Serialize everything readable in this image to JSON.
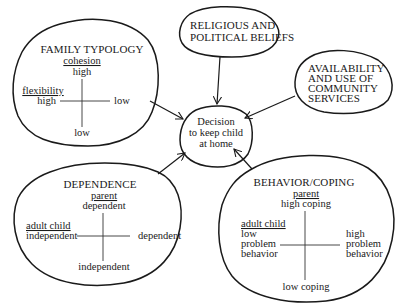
{
  "diagram": {
    "center": {
      "lines": [
        "Decision",
        "to keep child",
        "at home"
      ]
    },
    "family_typology": {
      "title": "FAMILY TYPOLOGY",
      "vertical_axis_label": "cohesion",
      "vertical_top": "high",
      "vertical_bottom": "low",
      "horizontal_axis_label": "flexibility",
      "horizontal_left": "high",
      "horizontal_right": "low"
    },
    "religious": {
      "lines": [
        "RELIGIOUS AND",
        "POLITICAL BELIEFS"
      ]
    },
    "community": {
      "lines": [
        "AVAILABILITY",
        "AND USE OF",
        "COMMUNITY",
        "SERVICES"
      ]
    },
    "dependence": {
      "title": "DEPENDENCE",
      "vertical_axis_label": "parent",
      "vertical_top": "dependent",
      "vertical_bottom": "independent",
      "horizontal_axis_label": "adult child",
      "horizontal_left": "independent",
      "horizontal_right": "dependent"
    },
    "behavior": {
      "title": "BEHAVIOR/COPING",
      "vertical_axis_label": "parent",
      "vertical_top": "high coping",
      "vertical_bottom": "low coping",
      "horizontal_axis_label": "adult child",
      "horizontal_left_lines": [
        "low",
        "problem",
        "behavior"
      ],
      "horizontal_right_lines": [
        "high",
        "problem",
        "behavior"
      ]
    },
    "edges": [
      {
        "from": "family_typology",
        "to": "center"
      },
      {
        "from": "religious",
        "to": "center"
      },
      {
        "from": "community",
        "to": "center"
      },
      {
        "from": "dependence",
        "to": "center"
      },
      {
        "from": "behavior",
        "to": "center"
      }
    ]
  }
}
